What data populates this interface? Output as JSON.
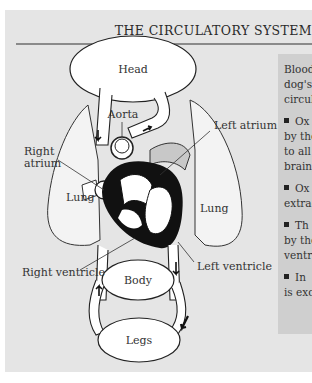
{
  "title": "THE CIRCULATORY SYSTEM",
  "diagram": {
    "labels": {
      "head": "Head",
      "aorta": "Aorta",
      "left_atrium": "Left atrium",
      "right_atrium_line1": "Right",
      "right_atrium_line2": "atrium",
      "lung_left": "Lung",
      "lung_right": "Lung",
      "right_ventricle": "Right ventricle",
      "left_ventricle": "Left ventricle",
      "body": "Body",
      "legs": "Legs"
    }
  },
  "info_box": {
    "intro_lines": [
      "Blood",
      "dog's",
      "circul"
    ],
    "bullets": [
      {
        "lines": [
          "Ox",
          "by the",
          "to all",
          "brain,"
        ]
      },
      {
        "lines": [
          "Ox",
          "extrac"
        ]
      },
      {
        "lines": [
          "Th",
          "by the",
          "ventri"
        ]
      },
      {
        "lines": [
          "In",
          "is exc"
        ]
      }
    ]
  },
  "colors": {
    "panel_bg": "#e5e5e5",
    "info_bg": "#cfcfcf",
    "vessel_fill": "#ffffff",
    "heart_dark": "#111111",
    "lung_fill": "#f2f2f2"
  }
}
